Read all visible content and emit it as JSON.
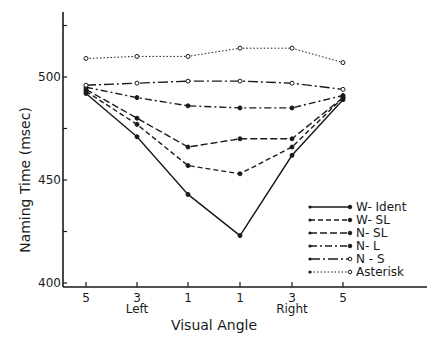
{
  "chart_data": {
    "type": "line",
    "title": "",
    "xlabel": "Visual Angle",
    "ylabel": "Naming Time (msec)",
    "categories": [
      "5",
      "3",
      "1",
      "1",
      "3",
      "5"
    ],
    "x_group_labels": [
      {
        "label": "Left",
        "under": 1
      },
      {
        "label": "Right",
        "under": 4
      }
    ],
    "ylim": [
      400,
      530
    ],
    "yticks": [
      400,
      425,
      450,
      475,
      500,
      525
    ],
    "ytick_labels": [
      "400",
      "",
      "450",
      "",
      "500",
      ""
    ],
    "grid": false,
    "legend_position": "lower right",
    "series": [
      {
        "name": "W- Ident",
        "style": "solid",
        "marker": "filled",
        "values": [
          492,
          471,
          443,
          423,
          462,
          489
        ]
      },
      {
        "name": "W- SL",
        "style": "dashed",
        "marker": "filled",
        "values": [
          493,
          477,
          457,
          453,
          466,
          490
        ]
      },
      {
        "name": "N- SL",
        "style": "longdash",
        "marker": "filled",
        "values": [
          494,
          480,
          466,
          470,
          470,
          490
        ]
      },
      {
        "name": "N- L",
        "style": "dashdot",
        "marker": "filled",
        "values": [
          495,
          490,
          486,
          485,
          485,
          491
        ]
      },
      {
        "name": "N - S",
        "style": "dashdot-long",
        "marker": "open",
        "values": [
          496,
          497,
          498,
          498,
          497,
          494
        ]
      },
      {
        "name": "Asterisk",
        "style": "dotted",
        "marker": "open",
        "values": [
          509,
          510,
          510,
          514,
          514,
          507
        ]
      }
    ]
  }
}
